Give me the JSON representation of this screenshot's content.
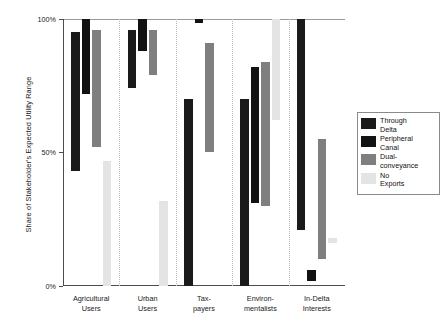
{
  "chart_data": {
    "type": "bar",
    "title": "",
    "subtitle": "",
    "xlabel": "",
    "ylabel": "Share of Stakeholder's Expected Utility Range",
    "ylim": [
      0,
      100
    ],
    "ytick_values": [
      0,
      50,
      100
    ],
    "ytick_labels": [
      "0%",
      "50%",
      "100%"
    ],
    "grid": false,
    "group_separators": true,
    "legend_position": "right",
    "bar_style": "floating-range",
    "categories": [
      "Agricultural\nUsers",
      "Urban\nUsers",
      "Tax-\npayers",
      "Environ-\nmentalists",
      "In-Delta\nInterests"
    ],
    "series": [
      {
        "name": "Through\nDelta",
        "legend_label": "Through\nDelta",
        "color": "#1a1a1a",
        "ranges": [
          {
            "category": "Agricultural Users",
            "low": 43,
            "high": 95
          },
          {
            "category": "Urban Users",
            "low": 74,
            "high": 96
          },
          {
            "category": "Tax-payers",
            "low": 0,
            "high": 70
          },
          {
            "category": "Environmentalists",
            "low": 0,
            "high": 70
          },
          {
            "category": "In-Delta Interests",
            "low": 21,
            "high": 100
          }
        ]
      },
      {
        "name": "Peripheral\nCanal",
        "legend_label": "Peripheral\nCanal",
        "color": "#121212",
        "ranges": [
          {
            "category": "Agricultural Users",
            "low": 72,
            "high": 100
          },
          {
            "category": "Urban Users",
            "low": 88,
            "high": 100
          },
          {
            "category": "Tax-payers",
            "low": 98.5,
            "high": 100
          },
          {
            "category": "Environmentalists",
            "low": 31,
            "high": 82
          },
          {
            "category": "In-Delta Interests",
            "low": 2,
            "high": 6
          }
        ]
      },
      {
        "name": "Dual-\nconveyance",
        "legend_label": "Dual-\nconveyance",
        "color": "#7f7f7f",
        "ranges": [
          {
            "category": "Agricultural Users",
            "low": 52,
            "high": 96
          },
          {
            "category": "Urban Users",
            "low": 79,
            "high": 96
          },
          {
            "category": "Tax-payers",
            "low": 50,
            "high": 91
          },
          {
            "category": "Environmentalists",
            "low": 30,
            "high": 84
          },
          {
            "category": "In-Delta Interests",
            "low": 10,
            "high": 55
          }
        ]
      },
      {
        "name": "No\nExports",
        "legend_label": "No\nExports",
        "color": "#e4e4e4",
        "ranges": [
          {
            "category": "Agricultural Users",
            "low": 0,
            "high": 47
          },
          {
            "category": "Urban Users",
            "low": 0,
            "high": 32
          },
          {
            "category": "Tax-payers",
            "low": 0,
            "high": 0
          },
          {
            "category": "Environmentalists",
            "low": 62,
            "high": 100
          },
          {
            "category": "In-Delta Interests",
            "low": 16,
            "high": 18
          }
        ]
      }
    ]
  },
  "legend": {
    "items": [
      {
        "label": "Through\nDelta",
        "color": "#1a1a1a"
      },
      {
        "label": "Peripheral\nCanal",
        "color": "#121212"
      },
      {
        "label": "Dual-\nconveyance",
        "color": "#7f7f7f"
      },
      {
        "label": "No\nExports",
        "color": "#e4e4e4"
      }
    ]
  }
}
